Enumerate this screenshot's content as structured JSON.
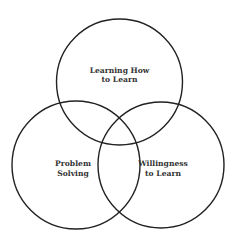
{
  "diagram": {
    "type": "venn",
    "colors": {
      "stroke": "#222222",
      "text": "#333333",
      "background": "#ffffff"
    },
    "sets": [
      {
        "id": "learning-how-to-learn",
        "label_lines": [
          "Learning How",
          "to Learn"
        ],
        "circle": {
          "cx": 119.5,
          "cy": 82,
          "r": 63
        },
        "label_pos": {
          "x": 119.5,
          "y1": 73,
          "y2": 82
        }
      },
      {
        "id": "problem-solving",
        "label_lines": [
          "Problem",
          "Solving"
        ],
        "circle": {
          "cx": 76,
          "cy": 165,
          "r": 64
        },
        "label_pos": {
          "x": 73,
          "y1": 166,
          "y2": 176
        }
      },
      {
        "id": "willingness-to-learn",
        "label_lines": [
          "Willingness",
          "to Learn"
        ],
        "circle": {
          "cx": 161,
          "cy": 165,
          "r": 63
        },
        "label_pos": {
          "x": 163,
          "y1": 166,
          "y2": 176
        }
      }
    ]
  }
}
